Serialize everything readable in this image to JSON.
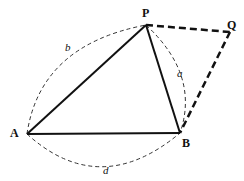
{
  "figure": {
    "vertices": {
      "P": {
        "label": "P",
        "x": 146,
        "y": 25
      },
      "Q": {
        "label": "Q",
        "x": 230,
        "y": 32
      },
      "A": {
        "label": "A",
        "x": 27,
        "y": 134
      },
      "B": {
        "label": "B",
        "x": 180,
        "y": 133
      }
    },
    "side_labels": {
      "a": "a",
      "b": "b",
      "d": "d"
    },
    "colors": {
      "stroke": "#111111",
      "background": "#ffffff"
    }
  }
}
